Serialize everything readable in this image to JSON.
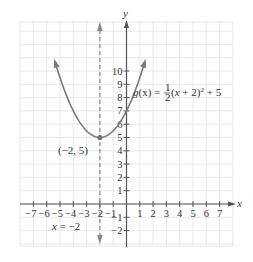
{
  "chart_data": {
    "type": "line",
    "title": "",
    "xlabel": "x",
    "ylabel": "y",
    "xlim": [
      -8,
      8
    ],
    "ylim": [
      -3,
      13.7
    ],
    "grid": true,
    "x_ticks": [
      -7,
      -6,
      -5,
      -4,
      -3,
      -2,
      -1,
      1,
      2,
      3,
      4,
      5,
      6,
      7
    ],
    "y_ticks": [
      -2,
      -1,
      1,
      2,
      3,
      4,
      5,
      6,
      7,
      8,
      9,
      10
    ],
    "x_tick_labels": [
      "−7",
      "−6",
      "−5",
      "−4",
      "−3",
      "−2",
      "−1",
      "1",
      "2",
      "3",
      "4",
      "5",
      "6",
      "7"
    ],
    "y_tick_labels": [
      "−2",
      "−1",
      "1",
      "2",
      "3",
      "4",
      "5",
      "6",
      "7",
      "8",
      "9",
      "10"
    ],
    "series": [
      {
        "name": "g(x) = 1/2 (x + 2)^2 + 5",
        "function": "0.5*(x+2)^2+5",
        "x_range": [
          -6.6,
          0.6
        ],
        "x": [
          -6.6,
          -6,
          -5,
          -4,
          -3,
          -2,
          -1,
          0,
          0.6
        ],
        "values": [
          15.58,
          13,
          9.5,
          7,
          5.5,
          5,
          5.5,
          7,
          8.38
        ],
        "color": "#7a7a7a",
        "arrows": "both-ends"
      }
    ],
    "asymptote_line": {
      "type": "vertical-dashed",
      "x": -2,
      "label": "x = −2",
      "color": "#888888"
    },
    "annotations": [
      {
        "text": "g(x) = ½(x + 2)² + 5",
        "x": -0.2,
        "y": 8
      },
      {
        "text": "(−2, 5)",
        "point": [
          -2,
          5
        ],
        "label_pos": [
          -4.6,
          4.1
        ]
      },
      {
        "text": "x = −2",
        "label_pos": [
          -5.2,
          -1.6
        ]
      }
    ]
  },
  "labels": {
    "x_axis": "x",
    "y_axis": "y",
    "function_label": {
      "g": "g",
      "paren_x": "(x) = ",
      "num": "1",
      "den": "2",
      "rest_a": "(",
      "rest_x": "x",
      "rest_b": " + 2)",
      "sup": "2",
      "rest_c": " + 5"
    },
    "vertex_label": "(−2, 5)",
    "axis_of_symmetry_label": {
      "x": "x",
      "rest": " = −2"
    }
  }
}
